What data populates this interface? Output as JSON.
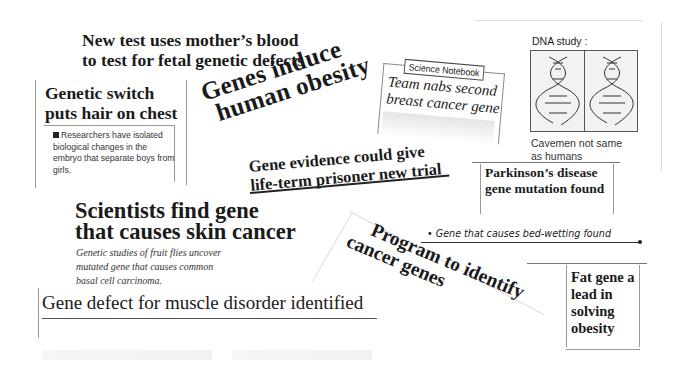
{
  "clippings": {
    "mother_blood": {
      "line1": "New test uses mother’s blood",
      "line2": "to test for fetal genetic defects"
    },
    "genetic_switch": {
      "headline1": "Genetic switch",
      "headline2": "puts hair on chest",
      "body": "Researchers have isolated biological changes in the embryo that separate boys from girls."
    },
    "obesity": {
      "line1": "Genes induce",
      "line2": "human obesity"
    },
    "prisoner": {
      "line1": "Gene evidence could give",
      "line2": "life-term prisoner new trial"
    },
    "notebook": {
      "label": "Science Notebook",
      "line1": "Team nabs second",
      "line2": "breast cancer gene"
    },
    "dna": {
      "title": "DNA study :",
      "caption_line1": "Cavemen not same",
      "caption_line2": "as humans"
    },
    "parkinsons": {
      "line1": "Parkinson’s disease",
      "line2": "gene mutation found"
    },
    "skin_cancer": {
      "line1": "Scientists find gene",
      "line2": "that causes skin cancer",
      "body1": "Genetic studies of fruit flies uncover",
      "body2": "mutated gene that causes common",
      "body3": "basal cell carcinoma."
    },
    "muscle": {
      "headline": "Gene defect for muscle disorder identified"
    },
    "program": {
      "line1": "Program to identify",
      "line2": "cancer genes"
    },
    "bed_wetting": {
      "headline": "• Gene that causes bed-wetting found"
    },
    "fat_gene": {
      "line1": "Fat gene a",
      "line2": "lead in",
      "line3": "solving",
      "line4": "obesity"
    }
  }
}
